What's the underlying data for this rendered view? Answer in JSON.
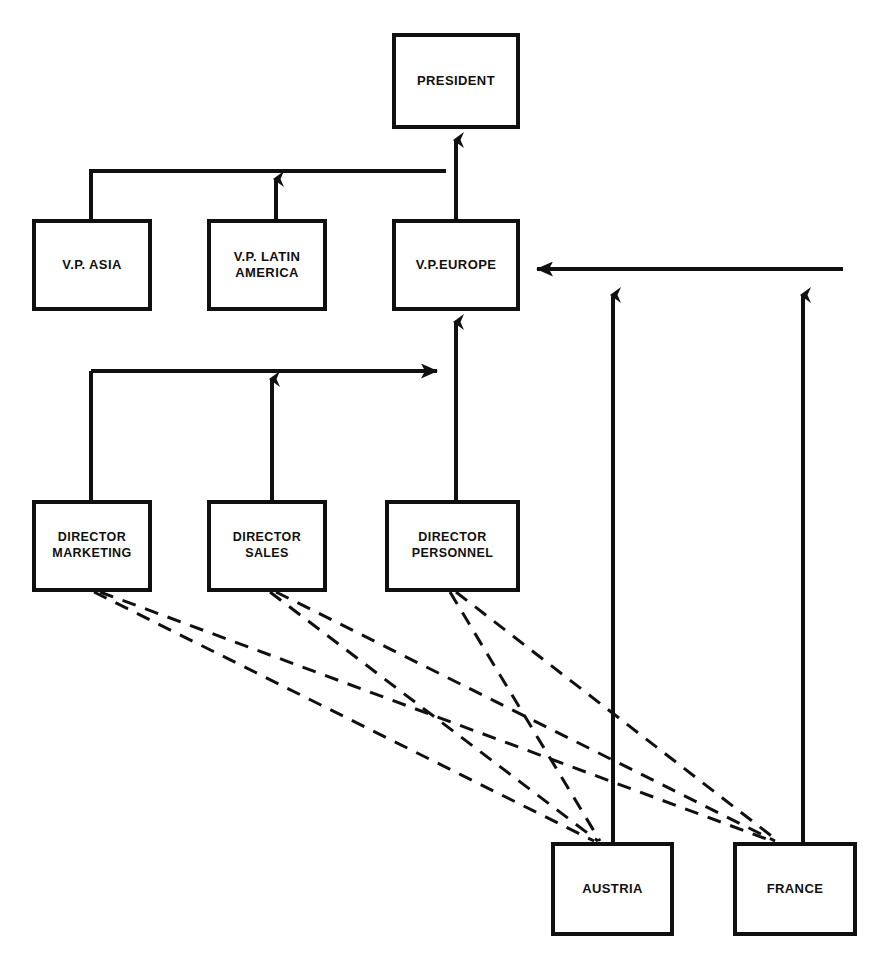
{
  "diagram": {
    "type": "org-chart",
    "canvas": {
      "width": 883,
      "height": 972
    },
    "style": {
      "line_color": "#101010",
      "box_border_color": "#101010",
      "box_fill_color": "#ffffff",
      "background_color": "#ffffff",
      "solid_line_width": 4,
      "dashed_line_width": 3,
      "dash_pattern": "14 10"
    }
  },
  "nodes": [
    {
      "id": "president",
      "label": "PRESIDENT",
      "level": "executive",
      "x": 392,
      "y": 33,
      "w": 128,
      "h": 96
    },
    {
      "id": "vp-asia",
      "label": "V.P. ASIA",
      "level": "vice-president",
      "x": 32,
      "y": 219,
      "w": 120,
      "h": 92
    },
    {
      "id": "vp-latin-america",
      "label": "V.P. LATIN\nAMERICA",
      "level": "vice-president",
      "x": 207,
      "y": 219,
      "w": 120,
      "h": 92
    },
    {
      "id": "vp-europe",
      "label": "V.P.EUROPE",
      "level": "vice-president",
      "x": 392,
      "y": 219,
      "w": 128,
      "h": 92
    },
    {
      "id": "director-marketing",
      "label": "DIRECTOR\nMARKETING",
      "level": "director",
      "x": 32,
      "y": 500,
      "w": 120,
      "h": 92
    },
    {
      "id": "director-sales",
      "label": "DIRECTOR\nSALES",
      "level": "director",
      "x": 207,
      "y": 500,
      "w": 120,
      "h": 92
    },
    {
      "id": "director-personnel",
      "label": "DIRECTOR\nPERSONNEL",
      "level": "director",
      "x": 385,
      "y": 500,
      "w": 135,
      "h": 92
    },
    {
      "id": "austria",
      "label": "AUSTRIA",
      "level": "country",
      "x": 551,
      "y": 842,
      "w": 123,
      "h": 94
    },
    {
      "id": "france",
      "label": "FRANCE",
      "level": "country",
      "x": 733,
      "y": 842,
      "w": 124,
      "h": 94
    }
  ],
  "edges": [
    {
      "id": "edge-vp-europe-to-president",
      "from": "vp-europe",
      "to": "president",
      "style": "solid",
      "arrow": "up"
    },
    {
      "id": "edge-vp-asia-to-bus",
      "from": "vp-asia",
      "to": "vp-bus",
      "style": "solid",
      "arrow": "none"
    },
    {
      "id": "edge-vp-latin-america-to-bus",
      "from": "vp-latin-america",
      "to": "vp-bus",
      "style": "solid",
      "arrow": "up"
    },
    {
      "id": "edge-director-personnel-to-vp-europe",
      "from": "director-personnel",
      "to": "vp-europe",
      "style": "solid",
      "arrow": "up"
    },
    {
      "id": "edge-director-marketing-to-bus",
      "from": "director-marketing",
      "to": "director-bus",
      "style": "solid",
      "arrow": "none"
    },
    {
      "id": "edge-director-sales-to-bus",
      "from": "director-sales",
      "to": "director-bus",
      "style": "solid",
      "arrow": "up"
    },
    {
      "id": "edge-director-bus-to-personnel-riser",
      "from": "director-bus",
      "to": "director-personnel-riser",
      "style": "solid",
      "arrow": "right"
    },
    {
      "id": "edge-austria-to-country-bus",
      "from": "austria",
      "to": "country-bus",
      "style": "solid",
      "arrow": "up"
    },
    {
      "id": "edge-france-to-country-bus",
      "from": "france",
      "to": "country-bus",
      "style": "solid",
      "arrow": "up"
    },
    {
      "id": "edge-country-bus-to-vp-europe",
      "from": "country-bus",
      "to": "vp-europe",
      "style": "solid",
      "arrow": "left"
    },
    {
      "id": "edge-director-marketing-to-austria",
      "from": "director-marketing",
      "to": "austria",
      "style": "dashed",
      "arrow": "none"
    },
    {
      "id": "edge-director-marketing-to-france",
      "from": "director-marketing",
      "to": "france",
      "style": "dashed",
      "arrow": "none"
    },
    {
      "id": "edge-director-sales-to-austria",
      "from": "director-sales",
      "to": "austria",
      "style": "dashed",
      "arrow": "none"
    },
    {
      "id": "edge-director-sales-to-france",
      "from": "director-sales",
      "to": "france",
      "style": "dashed",
      "arrow": "none"
    },
    {
      "id": "edge-director-personnel-to-austria",
      "from": "director-personnel",
      "to": "austria",
      "style": "dashed",
      "arrow": "none"
    },
    {
      "id": "edge-director-personnel-to-france",
      "from": "director-personnel",
      "to": "france",
      "style": "dashed",
      "arrow": "none"
    }
  ]
}
